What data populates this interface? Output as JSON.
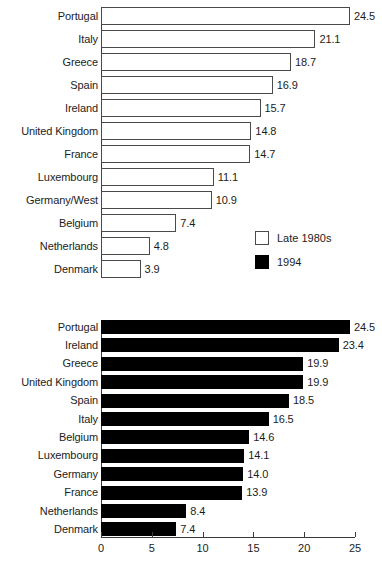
{
  "figure": {
    "background": "#ffffff",
    "bar_outline_color": "#4a4a4a",
    "bar_fill_color": "#000000",
    "axis_color": "#3a3a3a",
    "text_color": "#1c1c1c"
  },
  "legend": {
    "position": "inside-right-of-top-panel",
    "items": [
      {
        "label": "Late 1980s",
        "style": "hollow"
      },
      {
        "label": "1994",
        "style": "solid"
      }
    ]
  },
  "chart_data": [
    {
      "id": "late-1980s",
      "type": "bar",
      "orientation": "horizontal",
      "title": "",
      "xlabel": "",
      "ylabel": "",
      "series_name": "Late 1980s",
      "bar_style": "hollow",
      "xlim": [
        0,
        25
      ],
      "grid": false,
      "axis_visible": {
        "x": false,
        "y": true
      },
      "categories": [
        "Portugal",
        "Italy",
        "Greece",
        "Spain",
        "Ireland",
        "United Kingdom",
        "France",
        "Luxembourg",
        "Germany/West",
        "Belgium",
        "Netherlands",
        "Denmark"
      ],
      "values": [
        24.5,
        21.1,
        18.7,
        16.9,
        15.7,
        14.8,
        14.7,
        11.1,
        10.9,
        7.4,
        4.8,
        3.9
      ],
      "value_labels": [
        "24.5",
        "21.1",
        "18.7",
        "16.9",
        "15.7",
        "14.8",
        "14.7",
        "11.1",
        "10.9",
        "7.4",
        "4.8",
        "3.9"
      ]
    },
    {
      "id": "1994",
      "type": "bar",
      "orientation": "horizontal",
      "title": "",
      "xlabel": "",
      "ylabel": "",
      "series_name": "1994",
      "bar_style": "solid",
      "xlim": [
        0,
        25
      ],
      "grid": false,
      "axis_visible": {
        "x": true,
        "y": true
      },
      "xticks": [
        0,
        5,
        10,
        15,
        20,
        25
      ],
      "xtick_labels": [
        "0",
        "5",
        "10",
        "15",
        "20",
        "25"
      ],
      "categories": [
        "Portugal",
        "Ireland",
        "Greece",
        "United Kingdom",
        "Spain",
        "Italy",
        "Belgium",
        "Luxembourg",
        "Germany",
        "France",
        "Netherlands",
        "Denmark"
      ],
      "values": [
        24.5,
        23.4,
        19.9,
        19.9,
        18.5,
        16.5,
        14.6,
        14.1,
        14.0,
        13.9,
        8.4,
        7.4
      ],
      "value_labels": [
        "24.5",
        "23.4",
        "19.9",
        "19.9",
        "18.5",
        "16.5",
        "14.6",
        "14.1",
        "14.0",
        "13.9",
        "8.4",
        "7.4"
      ]
    }
  ]
}
